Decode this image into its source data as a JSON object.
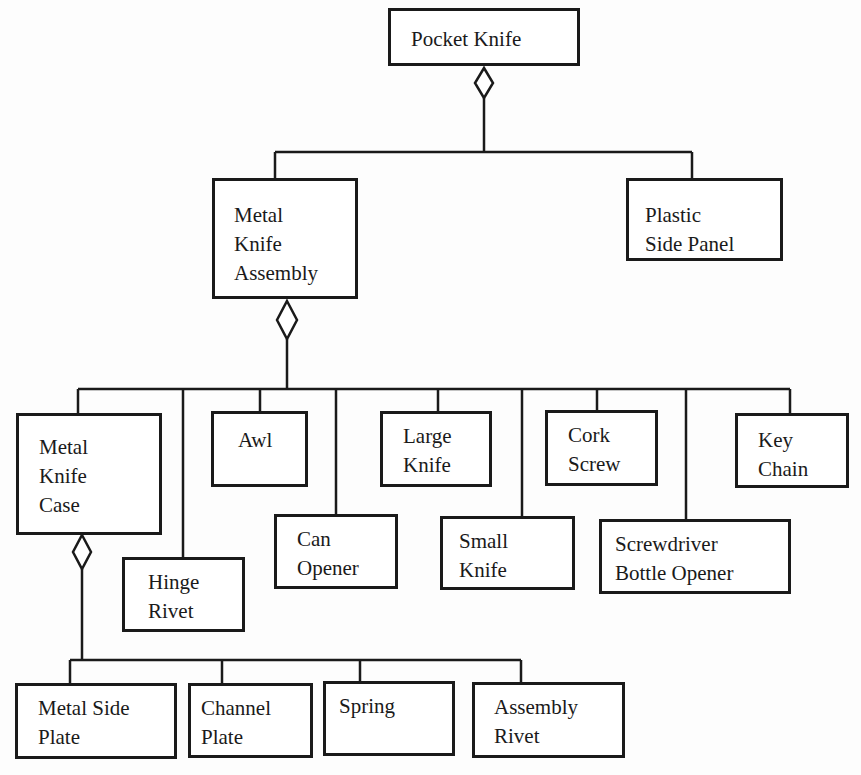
{
  "diagram": {
    "type": "aggregation-hierarchy",
    "line_color": "#1a1a1a",
    "nodes": {
      "pocket_knife": {
        "lines": [
          "Pocket Knife"
        ]
      },
      "metal_knife_assembly": {
        "lines": [
          "Metal",
          "Knife",
          "Assembly"
        ]
      },
      "plastic_side_panel": {
        "lines": [
          "Plastic",
          "Side Panel"
        ]
      },
      "metal_knife_case": {
        "lines": [
          "Metal",
          "Knife",
          "Case"
        ]
      },
      "hinge_rivet": {
        "lines": [
          "Hinge",
          "Rivet"
        ]
      },
      "awl": {
        "lines": [
          "Awl"
        ]
      },
      "can_opener": {
        "lines": [
          "Can",
          "Opener"
        ]
      },
      "large_knife": {
        "lines": [
          "Large",
          "Knife"
        ]
      },
      "small_knife": {
        "lines": [
          "Small",
          "Knife"
        ]
      },
      "cork_screw": {
        "lines": [
          "Cork",
          "Screw"
        ]
      },
      "screwdriver_bottle_opener": {
        "lines": [
          "Screwdriver",
          "Bottle Opener"
        ]
      },
      "key_chain": {
        "lines": [
          "Key",
          "Chain"
        ]
      },
      "metal_side_plate": {
        "lines": [
          "Metal Side",
          "Plate"
        ]
      },
      "channel_plate": {
        "lines": [
          "Channel",
          "Plate"
        ]
      },
      "spring": {
        "lines": [
          "Spring"
        ]
      },
      "assembly_rivet": {
        "lines": [
          "Assembly",
          "Rivet"
        ]
      }
    },
    "edges": [
      {
        "whole": "Pocket Knife",
        "parts": [
          "Metal Knife Assembly",
          "Plastic Side Panel"
        ]
      },
      {
        "whole": "Metal Knife Assembly",
        "parts": [
          "Metal Knife Case",
          "Hinge Rivet",
          "Awl",
          "Can Opener",
          "Large Knife",
          "Small Knife",
          "Cork Screw",
          "Screwdriver Bottle Opener",
          "Key Chain"
        ]
      },
      {
        "whole": "Metal Knife Case",
        "parts": [
          "Metal Side Plate",
          "Channel Plate",
          "Spring",
          "Assembly Rivet"
        ]
      }
    ]
  }
}
